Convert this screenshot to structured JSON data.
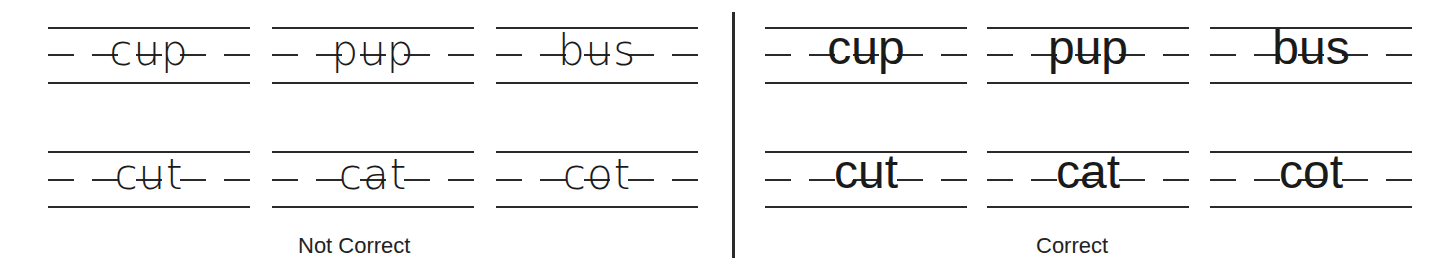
{
  "diagram": {
    "topic": "Handwriting letter formation on ruled lines",
    "ruling": {
      "lines": [
        "top line",
        "dashed midline",
        "base line"
      ],
      "line_color": "#2a2a2a"
    },
    "panels": [
      {
        "label": "Not Correct",
        "style": "irregular letter formation (letters misaligned, crossing lines, inconsistent sizing)",
        "rows": [
          [
            "cup",
            "pup",
            "bus"
          ],
          [
            "cut",
            "cat",
            "cot"
          ]
        ]
      },
      {
        "label": "Correct",
        "style": "consistent letters sitting on base line, x-height to midline, ascenders to top line, descenders below base",
        "rows": [
          [
            "cup",
            "pup",
            "bus"
          ],
          [
            "cut",
            "cat",
            "cot"
          ]
        ]
      }
    ]
  }
}
